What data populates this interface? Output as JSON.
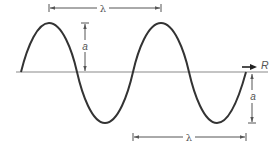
{
  "diagram": {
    "title": "",
    "colors": {
      "wave": "#333333",
      "baseline": "#8a8a8a",
      "dimension": "#555555",
      "arrow": "#222222"
    },
    "labels": {
      "wavelength_top": "λ",
      "wavelength_bottom": "λ",
      "amplitude_left": "a",
      "amplitude_right": "a",
      "direction": "R"
    },
    "wave": {
      "cycles": 2,
      "start_phase": "zero-crossing rising",
      "description": "Sinusoidal wave over two wavelengths along horizontal axis"
    }
  }
}
